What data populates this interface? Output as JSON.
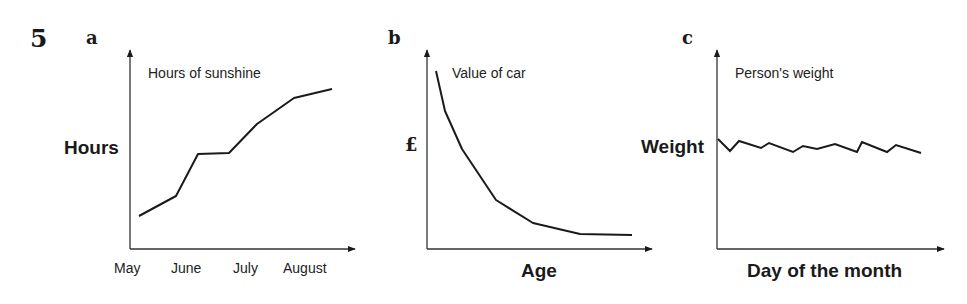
{
  "question_number": "5",
  "chart_data": [
    {
      "type": "line",
      "panel": "a",
      "title": "Hours of sunshine",
      "xlabel": "",
      "ylabel": "Hours",
      "categories": [
        "May",
        "June",
        "July",
        "August"
      ],
      "x": [
        0,
        1,
        2,
        3,
        4,
        5,
        6
      ],
      "values": [
        15,
        27,
        55,
        56,
        74,
        91,
        97
      ],
      "xlim": [
        0,
        6
      ],
      "ylim": [
        0,
        100
      ],
      "grid": false,
      "legend": "none",
      "points_px": [
        [
          139,
          216
        ],
        [
          176,
          196
        ],
        [
          198,
          154
        ],
        [
          229,
          153
        ],
        [
          257,
          124
        ],
        [
          294,
          98
        ],
        [
          332,
          89
        ]
      ],
      "axes_px": {
        "origin": [
          130,
          249
        ],
        "y_top": 50,
        "x_end": 355
      }
    },
    {
      "type": "line",
      "panel": "b",
      "title": "Value of car",
      "xlabel": "Age",
      "ylabel": "£",
      "x": [
        0,
        1,
        2,
        3,
        4,
        5,
        6
      ],
      "values": [
        100,
        78,
        56,
        27,
        14,
        8,
        7
      ],
      "ylim": [
        0,
        100
      ],
      "grid": false,
      "legend": "none",
      "points_px": [
        [
          436,
          71
        ],
        [
          445,
          111
        ],
        [
          462,
          149
        ],
        [
          496,
          200
        ],
        [
          533,
          223
        ],
        [
          580,
          234
        ],
        [
          632,
          235
        ]
      ],
      "axes_px": {
        "origin": [
          427,
          249
        ],
        "y_top": 50,
        "x_end": 652
      }
    },
    {
      "type": "line",
      "panel": "c",
      "title": "Person's weight",
      "xlabel": "Day of the month",
      "ylabel": "Weight",
      "values": [
        62,
        55,
        61,
        57,
        60,
        55,
        58,
        56,
        59,
        55,
        61,
        55,
        59,
        54
      ],
      "ylim": [
        0,
        100
      ],
      "grid": false,
      "legend": "none",
      "points_px": [
        [
          718,
          139
        ],
        [
          730,
          151
        ],
        [
          739,
          141
        ],
        [
          761,
          148
        ],
        [
          769,
          143
        ],
        [
          793,
          152
        ],
        [
          803,
          146
        ],
        [
          817,
          149
        ],
        [
          835,
          144
        ],
        [
          857,
          152
        ],
        [
          862,
          142
        ],
        [
          887,
          152
        ],
        [
          896,
          145
        ],
        [
          921,
          153
        ]
      ],
      "axes_px": {
        "origin": [
          717,
          249
        ],
        "y_top": 50,
        "x_end": 944
      }
    }
  ],
  "panels": {
    "a": {
      "label": "a",
      "title": "Hours of sunshine",
      "ylabel": "Hours",
      "ticks": [
        "May",
        "June",
        "July",
        "August"
      ]
    },
    "b": {
      "label": "b",
      "title": "Value of car",
      "ylabel": "£",
      "xlabel": "Age"
    },
    "c": {
      "label": "c",
      "title": "Person's weight",
      "ylabel": "Weight",
      "xlabel": "Day of the month"
    }
  },
  "colors": {
    "ink": "#1a1a1a",
    "axis": "#333333"
  }
}
